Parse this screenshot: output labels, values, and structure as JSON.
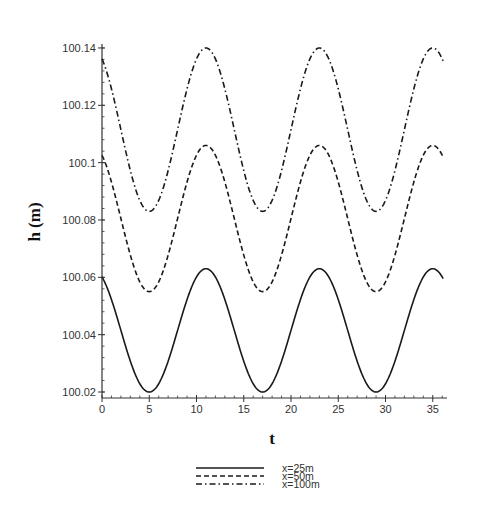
{
  "chart_data": {
    "type": "line",
    "title": "",
    "xlabel": "t",
    "ylabel": "h (m)",
    "xlim": [
      0,
      36.5
    ],
    "ylim": [
      100.0179,
      100.141
    ],
    "xticks": [
      0,
      5,
      10,
      15,
      20,
      25,
      30,
      35
    ],
    "yticks": [
      100.02,
      100.04,
      100.06,
      100.08,
      100.1,
      100.12,
      100.14
    ],
    "ytick_labels": [
      "100.02",
      "100.04",
      "100.06",
      "100.08",
      "100.1",
      "100.12",
      "100.14"
    ],
    "xtick_labels": [
      "0",
      "5",
      "10",
      "15",
      "20",
      "25",
      "30",
      "35"
    ],
    "grid": false,
    "legend_position": "bottom-center",
    "period": 12,
    "series": [
      {
        "name": "x=25m",
        "style": "solid",
        "mean": 100.0415,
        "amplitude": 0.0215,
        "peak_t": 11,
        "x": [
          0,
          2,
          5,
          8,
          11,
          14,
          17,
          20,
          23,
          26,
          29,
          32,
          35,
          36
        ],
        "values": [
          100.06,
          100.046,
          100.02,
          100.036,
          100.063,
          100.046,
          100.02,
          100.036,
          100.063,
          100.046,
          100.02,
          100.036,
          100.063,
          100.061
        ]
      },
      {
        "name": "x=50m",
        "style": "dashed",
        "mean": 100.0805,
        "amplitude": 0.0255,
        "peak_t": 11,
        "x": [
          0,
          2,
          5,
          8,
          11,
          14,
          17,
          20,
          23,
          26,
          29,
          32,
          35,
          36
        ],
        "values": [
          100.102,
          100.082,
          100.055,
          100.078,
          100.106,
          100.083,
          100.055,
          100.078,
          100.106,
          100.083,
          100.055,
          100.078,
          100.106,
          100.104
        ]
      },
      {
        "name": "x=100m",
        "style": "dash-dot",
        "mean": 100.1115,
        "amplitude": 0.0285,
        "peak_t": 11,
        "x": [
          0,
          2,
          5,
          8,
          11,
          14,
          17,
          20,
          23,
          26,
          29,
          32,
          35,
          36
        ],
        "values": [
          100.137,
          100.114,
          100.083,
          100.108,
          100.14,
          100.114,
          100.083,
          100.108,
          100.14,
          100.114,
          100.083,
          100.108,
          100.14,
          100.138
        ]
      }
    ]
  },
  "colors": {
    "line": "#1a1a1a",
    "axis": "#333333",
    "background": "#ffffff"
  }
}
